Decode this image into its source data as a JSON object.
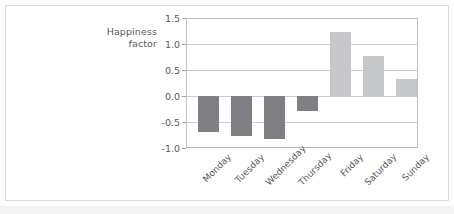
{
  "figure": {
    "background_color": "#ffffff",
    "frame_color": "#d8dde0"
  },
  "chart_data": {
    "type": "bar",
    "title": "",
    "subtitle": "",
    "xlabel": "",
    "ylabel": "Happiness factor",
    "ylabel_line1": "Happiness",
    "ylabel_line2": "factor",
    "categories": [
      "Monday",
      "Tuesday",
      "Wednesday",
      "Thursday",
      "Friday",
      "Saturday",
      "Sunday"
    ],
    "values": [
      -0.7,
      -0.77,
      -0.83,
      -0.28,
      1.23,
      0.77,
      0.33
    ],
    "ylim": [
      -1.0,
      1.5
    ],
    "yticks": [
      1.5,
      1.0,
      0.5,
      0.0,
      -0.5,
      -1.0
    ],
    "ytick_labels": [
      "1.5",
      "1.0",
      "0.5",
      "0.0",
      "-0.5",
      "-1.0"
    ],
    "grid": true,
    "grid_axis": "y",
    "legend": false,
    "legend_position": "none",
    "bar_colors": {
      "negative": "#7f8083",
      "positive": "#c6c7c9"
    },
    "xtick_rotation": -45
  }
}
